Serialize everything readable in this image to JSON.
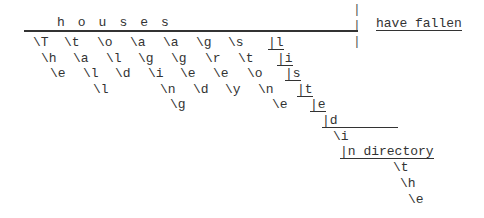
{
  "poem": {
    "title_word": "h o u s e s",
    "right_phrase": "have fallen",
    "separator": "|",
    "row2": [
      "\\T",
      "\\t",
      "\\o",
      "\\a",
      "\\a",
      "\\g",
      "\\s",
      "|l"
    ],
    "row3": [
      "\\h",
      "\\a",
      "\\l",
      "\\g",
      "\\g",
      "\\r",
      "\\t",
      "|i"
    ],
    "row4": [
      "\\e",
      "\\l",
      "\\d",
      "\\i",
      "\\e",
      "\\e",
      "\\o",
      "|s"
    ],
    "row5": [
      "\\l",
      "\\n",
      "\\d",
      "\\y",
      "\\n",
      "|t"
    ],
    "row6": [
      "\\g",
      "\\e",
      "|e"
    ],
    "row7": [
      "|d"
    ],
    "row8": [
      "\\i"
    ],
    "row9": [
      "|n directory"
    ],
    "row10": [
      "\\t"
    ],
    "row11": [
      "\\h"
    ],
    "row12": [
      "\\e"
    ]
  }
}
